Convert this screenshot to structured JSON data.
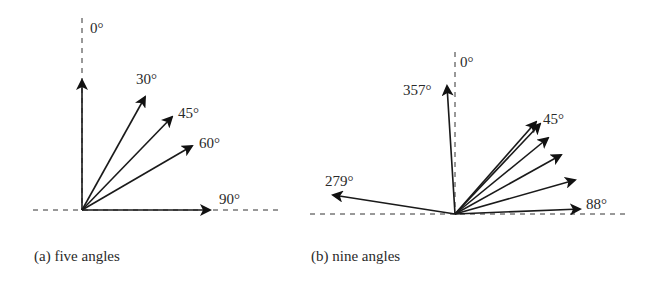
{
  "figure": {
    "panels": [
      {
        "id": "a",
        "caption": "(a) five angles",
        "origin": [
          82,
          210
        ],
        "arrows": [
          {
            "angle_deg": 0,
            "tip": [
              82,
              80
            ],
            "label": ""
          },
          {
            "angle_deg": 30,
            "tip": [
              145,
              97
            ],
            "label": "30°"
          },
          {
            "angle_deg": 45,
            "tip": [
              172,
              117
            ],
            "label": "45°"
          },
          {
            "angle_deg": 60,
            "tip": [
              192,
              146
            ],
            "label": "60°"
          },
          {
            "angle_deg": 90,
            "tip": [
              210,
              210
            ],
            "label": "90°"
          }
        ],
        "axis_labels": {
          "zero": "0°"
        }
      },
      {
        "id": "b",
        "caption": "(b) nine angles",
        "origin": [
          455,
          214
        ],
        "arrows": [
          {
            "angle_deg": 279,
            "tip": [
              333,
              195
            ],
            "label": "279°"
          },
          {
            "angle_deg": 357,
            "tip": [
              447,
              86
            ],
            "label": "357°"
          },
          {
            "angle_deg": 43,
            "tip": [
              536,
              122
            ],
            "label": ""
          },
          {
            "angle_deg": 45,
            "tip": [
              540,
              124
            ],
            "label": "45°"
          },
          {
            "angle_deg": 50,
            "tip": [
              548,
              138
            ],
            "label": ""
          },
          {
            "angle_deg": 57,
            "tip": [
              561,
              155
            ],
            "label": ""
          },
          {
            "angle_deg": 70,
            "tip": [
              575,
              180
            ],
            "label": ""
          },
          {
            "angle_deg": 88,
            "tip": [
              580,
              209
            ],
            "label": "88°"
          }
        ],
        "axis_labels": {
          "zero": "0°"
        }
      }
    ],
    "labels": {
      "a_zero": "0°",
      "a_30": "30°",
      "a_45": "45°",
      "a_60": "60°",
      "a_90": "90°",
      "b_zero": "0°",
      "b_357": "357°",
      "b_45": "45°",
      "b_279": "279°",
      "b_88": "88°",
      "caption_a": "(a) five angles",
      "caption_b": "(b) nine angles"
    }
  }
}
